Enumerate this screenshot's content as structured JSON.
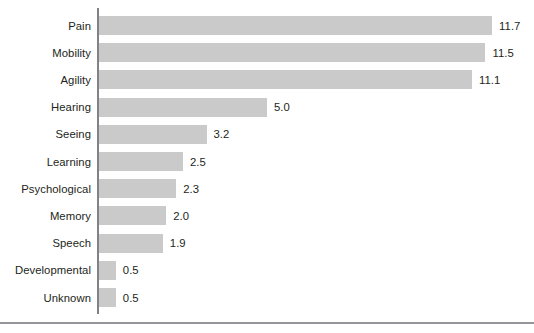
{
  "chart_data": {
    "type": "bar",
    "orientation": "horizontal",
    "title": "",
    "subtitle": "",
    "xlabel": "",
    "ylabel": "",
    "grid": false,
    "legend": false,
    "legend_position": "none",
    "xlim": [
      0,
      12.6
    ],
    "bar_color": "#cacaca",
    "axis_color": "#808285",
    "rule_color": "#939598",
    "text_color": "#231f20",
    "value_label_format": "one-decimal",
    "categories": [
      "Pain",
      "Mobility",
      "Agility",
      "Hearing",
      "Seeing",
      "Learning",
      "Psychological",
      "Memory",
      "Speech",
      "Developmental",
      "Unknown"
    ],
    "values": [
      11.7,
      11.5,
      11.1,
      5.0,
      3.2,
      2.5,
      2.3,
      2.0,
      1.9,
      0.5,
      0.5
    ],
    "value_labels": [
      "11.7",
      "11.5",
      "11.1",
      "5.0",
      "3.2",
      "2.5",
      "2.3",
      "2.0",
      "1.9",
      "0.5",
      "0.5"
    ],
    "bars": [
      {
        "category": "Pain",
        "value": 11.7,
        "label": "11.7"
      },
      {
        "category": "Mobility",
        "value": 11.5,
        "label": "11.5"
      },
      {
        "category": "Agility",
        "value": 11.1,
        "label": "11.1"
      },
      {
        "category": "Hearing",
        "value": 5.0,
        "label": "5.0"
      },
      {
        "category": "Seeing",
        "value": 3.2,
        "label": "3.2"
      },
      {
        "category": "Learning",
        "value": 2.5,
        "label": "2.5"
      },
      {
        "category": "Psychological",
        "value": 2.3,
        "label": "2.3"
      },
      {
        "category": "Memory",
        "value": 2.0,
        "label": "2.0"
      },
      {
        "category": "Speech",
        "value": 1.9,
        "label": "1.9"
      },
      {
        "category": "Developmental",
        "value": 0.5,
        "label": "0.5"
      },
      {
        "category": "Unknown",
        "value": 0.5,
        "label": "0.5"
      }
    ]
  }
}
